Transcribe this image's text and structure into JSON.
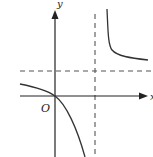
{
  "diagram": {
    "type": "function-graph",
    "labels": {
      "y_axis": "y",
      "x_axis": "x",
      "origin": "O"
    },
    "colors": {
      "axis": "#222222",
      "curve": "#333333",
      "asymptote": "#555555"
    },
    "asymptotes": {
      "vertical": "dashed vertical line right of y-axis",
      "horizontal": "dashed horizontal line above x-axis"
    },
    "branches": [
      "upper-right branch decreasing toward horizontal asymptote",
      "lower-left branch passing through origin, decreasing toward vertical asymptote"
    ]
  }
}
